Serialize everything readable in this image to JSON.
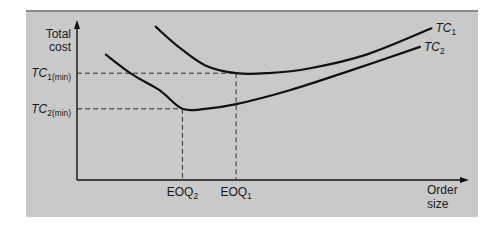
{
  "chart_data": {
    "type": "line",
    "title": "",
    "ylabel": [
      "Total",
      "cost"
    ],
    "xlabel": [
      "Order",
      "size"
    ],
    "xlim": [
      0,
      100
    ],
    "ylim": [
      0,
      100
    ],
    "grid": false,
    "legend": "inline-right",
    "series": [
      {
        "name": "TC1",
        "label_main": "TC",
        "label_sub": "1",
        "points": [
          [
            20,
            99
          ],
          [
            26,
            86
          ],
          [
            33,
            74
          ],
          [
            41,
            69
          ],
          [
            49,
            69
          ],
          [
            60,
            72
          ],
          [
            75,
            81
          ],
          [
            92,
            98
          ]
        ],
        "min_point": [
          41,
          69
        ]
      },
      {
        "name": "TC2",
        "label_main": "TC",
        "label_sub": "2",
        "points": [
          [
            7,
            81
          ],
          [
            14,
            68
          ],
          [
            21,
            58
          ],
          [
            27,
            46
          ],
          [
            33,
            46
          ],
          [
            41,
            49
          ],
          [
            55,
            58
          ],
          [
            70,
            70
          ],
          [
            89,
            86
          ]
        ],
        "min_point": [
          27,
          46
        ]
      }
    ],
    "reference_lines": {
      "horizontal": [
        {
          "name": "TC1(min)",
          "label_main": "TC",
          "label_sub": "1(min)",
          "y": 69
        },
        {
          "name": "TC2(min)",
          "label_main": "TC",
          "label_sub": "2(min)",
          "y": 46
        }
      ],
      "vertical": [
        {
          "name": "EOQ2",
          "label_main": "EOQ",
          "label_sub": "2",
          "x": 27
        },
        {
          "name": "EOQ1",
          "label_main": "EOQ",
          "label_sub": "1",
          "x": 41
        }
      ]
    },
    "annotations": [],
    "colors": {
      "background": "#c9c9c9",
      "line": "#111111",
      "dashed": "#333333",
      "text": "#1a1a1a"
    }
  }
}
